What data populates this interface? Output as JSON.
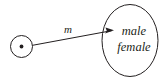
{
  "diagram": {
    "background_color": "#ffffff",
    "ink_color": "#231f20",
    "source_node": {
      "name": "point-mass",
      "symbol": "circled-dot",
      "center_x": 21.5,
      "center_y": 46.5,
      "radius": 11,
      "dot_radius": 1.8
    },
    "arrow": {
      "label": "m",
      "label_x": 68,
      "label_y": 33,
      "from_x": 32.5,
      "from_y": 45.3,
      "to_x": 114,
      "to_y": 30.2,
      "stroke_width": 1
    },
    "target_node": {
      "name": "population-ellipse",
      "center_x": 130,
      "center_y": 40.5,
      "radius_x": 28,
      "radius_y": 36,
      "stroke_width": 1,
      "items": [
        {
          "label": "male",
          "x": 134,
          "y": 35
        },
        {
          "label": "female",
          "x": 134,
          "y": 51
        }
      ]
    }
  }
}
